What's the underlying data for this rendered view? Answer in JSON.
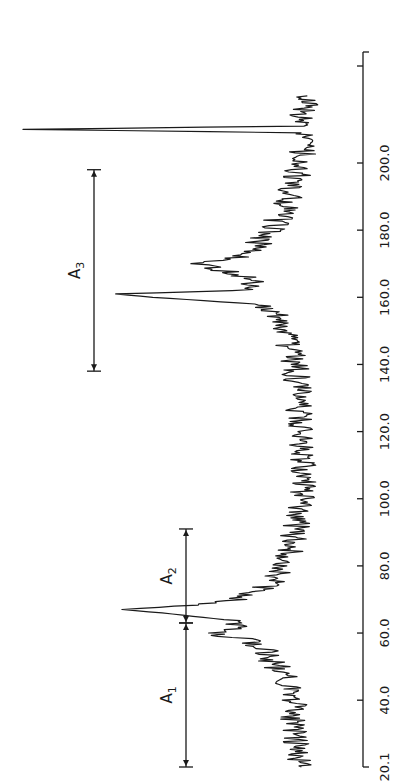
{
  "chart_data": {
    "type": "line",
    "orientation": "rotated-90 (x axis runs vertically, intensity increases to the left)",
    "title": "",
    "xlabel": "",
    "ylabel": "",
    "xlim": [
      20.1,
      220.0
    ],
    "grid": false,
    "legend": null,
    "x_ticks": [
      "20.1",
      "40.0",
      "60.0",
      "80.0",
      "100.0",
      "120.0",
      "140.0",
      "160.0",
      "180.0",
      "200.0"
    ],
    "x": [
      20.1,
      25,
      30,
      35,
      40,
      45,
      50,
      55,
      58,
      60,
      62,
      64,
      66,
      67,
      68,
      70,
      72,
      75,
      80,
      85,
      90,
      95,
      100,
      110,
      120,
      130,
      140,
      145,
      150,
      155,
      158,
      160,
      161,
      162,
      165,
      168,
      170,
      172,
      175,
      180,
      185,
      190,
      195,
      200,
      205,
      209,
      210,
      211,
      215,
      220
    ],
    "values": [
      10,
      12,
      11,
      13,
      12,
      14,
      18,
      22,
      28,
      40,
      30,
      35,
      55,
      68,
      50,
      32,
      25,
      20,
      15,
      13,
      12,
      11,
      10,
      9,
      10,
      11,
      12,
      14,
      15,
      18,
      25,
      58,
      70,
      30,
      26,
      35,
      42,
      30,
      25,
      20,
      16,
      14,
      12,
      10,
      9,
      10,
      100,
      12,
      9,
      8
    ],
    "annotations": [
      {
        "label": "A1",
        "from": 20.1,
        "to": 63.0
      },
      {
        "label": "A2",
        "from": 63.0,
        "to": 91.0
      },
      {
        "label": "A3",
        "from": 138.0,
        "to": 198.0
      }
    ],
    "peaks": [
      {
        "x": 67,
        "relative_height": 68
      },
      {
        "x": 161,
        "relative_height": 70
      },
      {
        "x": 210,
        "relative_height": 100
      }
    ]
  },
  "axis": {
    "ticks": [
      {
        "label": "20.1",
        "value": 20.1
      },
      {
        "label": "40.0",
        "value": 40.0
      },
      {
        "label": "60.0",
        "value": 60.0
      },
      {
        "label": "80.0",
        "value": 80.0
      },
      {
        "label": "100.0",
        "value": 100.0
      },
      {
        "label": "120.0",
        "value": 120.0
      },
      {
        "label": "140.0",
        "value": 140.0
      },
      {
        "label": "160.0",
        "value": 160.0
      },
      {
        "label": "180.0",
        "value": 180.0
      },
      {
        "label": "200.0",
        "value": 200.0
      }
    ]
  },
  "bands": {
    "a1": {
      "main": "A",
      "sub": "1"
    },
    "a2": {
      "main": "A",
      "sub": "2"
    },
    "a3": {
      "main": "A",
      "sub": "3"
    }
  },
  "colors": {
    "line": "#1a1a1a",
    "background": "#ffffff"
  }
}
